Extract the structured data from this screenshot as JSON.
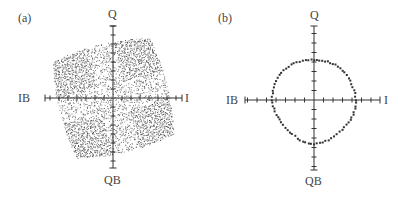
{
  "figure": {
    "panels": [
      {
        "tag": "(a)",
        "axes": {
          "top": "Q",
          "bottom": "QB",
          "left": "IB",
          "right": "I"
        },
        "description": "Dense scattered constellation filling a warped, rotated square region"
      },
      {
        "tag": "(b)",
        "axes": {
          "top": "Q",
          "bottom": "QB",
          "left": "IB",
          "right": "I"
        },
        "description": "Constellation points forming a roughly circular ring"
      }
    ]
  },
  "chart_data": [
    {
      "type": "scatter",
      "title": "(a)",
      "xlabel": "I / IB",
      "ylabel": "Q / QB",
      "axis_labels": {
        "positive_x": "I",
        "negative_x": "IB",
        "positive_y": "Q",
        "negative_y": "QB"
      },
      "shape": "dense points filling a warped square rotated ~15 degrees",
      "grid": false,
      "ticks": true
    },
    {
      "type": "scatter",
      "title": "(b)",
      "xlabel": "I / IB",
      "ylabel": "Q / QB",
      "axis_labels": {
        "positive_x": "I",
        "negative_x": "IB",
        "positive_y": "Q",
        "negative_y": "QB"
      },
      "shape": "ring of ~80 points, approximately circular",
      "approx_radius_ticks": 4,
      "x_ticks_per_side": 7,
      "y_ticks_per_side": 5,
      "grid": false,
      "ticks": true
    }
  ],
  "colors": {
    "ink": "#333333",
    "background": "#ffffff"
  }
}
